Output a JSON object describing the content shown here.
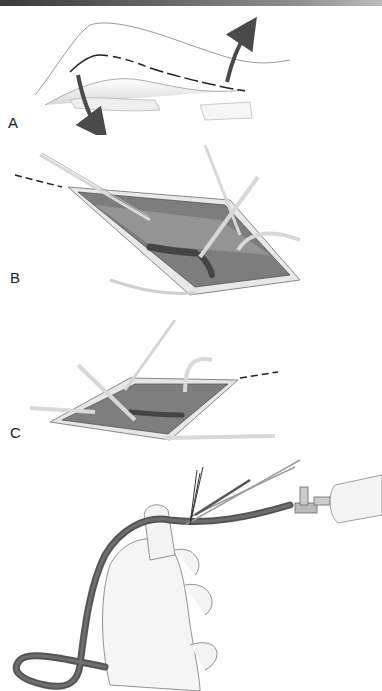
{
  "figure": {
    "panels": [
      {
        "id": "A",
        "label": "A",
        "description": "Leg with dashed incision line along medial thigh/calf; curved arrows indicate skin flap retraction"
      },
      {
        "id": "B",
        "label": "B",
        "description": "Open incision with retractors exposing vein; branch ligated"
      },
      {
        "id": "C",
        "label": "C",
        "description": "Continued dissection along vein with forceps and retractors"
      },
      {
        "id": "D",
        "label": "",
        "description": "Harvested vein held in hand, cannulated with syringe and stopcock; branches ligated with sutures and scissors"
      }
    ]
  },
  "colors": {
    "topbar_dark": "#3a3a3a",
    "topbar_light": "#bdbdbd",
    "line": "#333333",
    "arrow": "#4a4a4a",
    "tissue": "#8a8a8a",
    "tissue_dark": "#5e5e5e",
    "vein": "#555555",
    "skin": "#f2f2f2"
  }
}
